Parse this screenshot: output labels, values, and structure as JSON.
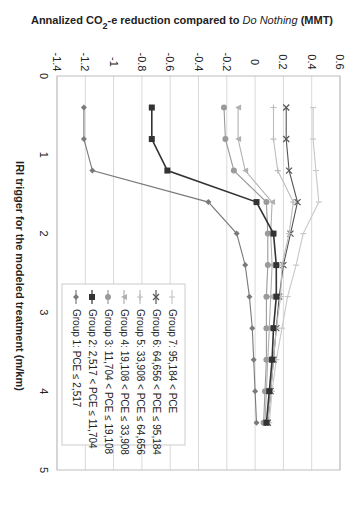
{
  "chart_data": {
    "type": "line",
    "orientation_note": "figure rotated 90 degrees clockwise",
    "title": "",
    "ylabel": "Annalized CO2-e reduction compared to Do Nothing (MMT)",
    "ylabel_parts": {
      "pre": "Annalized CO",
      "sub": "2",
      "mid": "-e reduction compared to ",
      "italic": "Do Nothing",
      "post": " (MMT)"
    },
    "xlabel": "IRI trigger for the modeled treatment (m/km)",
    "xlim": [
      0,
      5
    ],
    "ylim": [
      -1.4,
      0.6
    ],
    "x_ticks": [
      0,
      1,
      2,
      3,
      4,
      5
    ],
    "y_ticks": [
      -1.4,
      -1.2,
      -1,
      -0.8,
      -0.6,
      -0.4,
      -0.2,
      0,
      0.2,
      0.4,
      0.6
    ],
    "y_tick_labels": [
      "-1.4",
      "-1.2",
      "-1",
      "-0.8",
      "-0.6",
      "-0.4",
      "-0.2",
      "0",
      "0.2",
      "0.4",
      "0.6"
    ],
    "grid": true,
    "legend_position": "inside lower-left (rotated view)",
    "x": [
      0.4,
      0.8,
      1.2,
      1.6,
      2.0,
      2.4,
      2.8,
      3.2,
      3.6,
      4.0,
      4.4
    ],
    "series": [
      {
        "name": "Group 7: 95,184 < PCE",
        "color": "#c8c8c8",
        "marker": "dash",
        "values": [
          0.41,
          0.41,
          0.43,
          0.45,
          0.34,
          0.29,
          0.23,
          0.19,
          0.15,
          0.12,
          0.1
        ]
      },
      {
        "name": "Group 6: 64,656 < PCE ≤ 95,184",
        "color": "#555555",
        "marker": "x",
        "values": [
          0.22,
          0.22,
          0.24,
          0.3,
          0.25,
          0.2,
          0.17,
          0.15,
          0.13,
          0.11,
          0.09
        ]
      },
      {
        "name": "Group 5: 33,908 < PCE ≤ 64,656",
        "color": "#bdbdbd",
        "marker": "star",
        "values": [
          0.13,
          0.13,
          0.16,
          0.27,
          0.24,
          0.19,
          0.18,
          0.15,
          0.13,
          0.11,
          0.09
        ]
      },
      {
        "name": "Group 4: 19,108 < PCE ≤ 33,908",
        "color": "#b0b0b0",
        "marker": "triangle",
        "values": [
          -0.12,
          -0.12,
          -0.07,
          0.12,
          0.11,
          0.12,
          0.11,
          0.1,
          0.09,
          0.08,
          0.07
        ]
      },
      {
        "name": "Group 3: 11,704 < PCE ≤ 19,108",
        "color": "#9a9a9a",
        "marker": "circle",
        "values": [
          -0.22,
          -0.21,
          -0.15,
          0.08,
          0.09,
          0.09,
          0.08,
          0.08,
          0.08,
          0.07,
          0.06
        ]
      },
      {
        "name": "Group 2: 2,517 < PCE ≤ 11,704",
        "color": "#333333",
        "marker": "square",
        "values": [
          -0.73,
          -0.73,
          -0.62,
          0.01,
          0.13,
          0.15,
          0.15,
          0.13,
          0.12,
          0.1,
          0.08
        ]
      },
      {
        "name": "Group 1: PCE ≤ 2,517",
        "color": "#7a7a7a",
        "marker": "diamond",
        "values": [
          -1.21,
          -1.21,
          -1.15,
          -0.33,
          -0.13,
          -0.07,
          -0.04,
          -0.02,
          -0.01,
          0.0,
          0.01
        ]
      }
    ]
  }
}
